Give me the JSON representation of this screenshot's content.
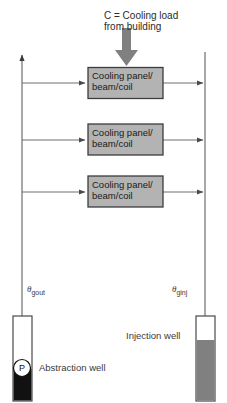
{
  "diagram": {
    "title_annotation": {
      "line1": "C = Cooling load",
      "line2": "from building"
    },
    "units": [
      {
        "line1": "Cooling panel/",
        "line2": "beam/coil"
      },
      {
        "line1": "Cooling panel/",
        "line2": "beam/coil"
      },
      {
        "line1": "Cooling panel/",
        "line2": "beam/coil"
      }
    ],
    "temperatures": {
      "abstraction": {
        "symbol": "θ",
        "subscript": "gout"
      },
      "injection": {
        "symbol": "θ",
        "subscript": "ginj"
      }
    },
    "wells": {
      "abstraction": {
        "label": "Abstraction well",
        "pump_label": "P"
      },
      "injection": {
        "label": "Injection well"
      }
    },
    "colors": {
      "box_fill": "#b3b3b3",
      "box_stroke": "#3c3c3c",
      "load_arrow": "#808080",
      "pipe": "#6e6e6e",
      "water_dark": "#111111",
      "water_gray": "#808080",
      "well_stroke": "#4a4a4a",
      "text": "#2b2b2b"
    }
  }
}
